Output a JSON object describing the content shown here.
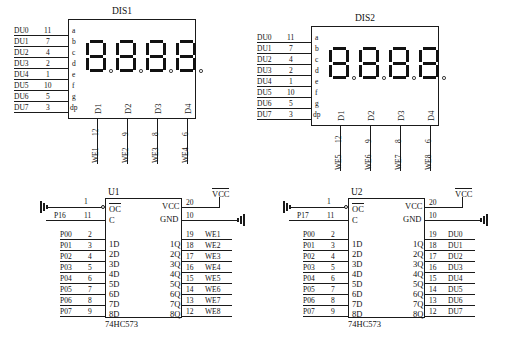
{
  "diagram": {
    "line_color": "#1a1a1a",
    "background": "#ffffff"
  },
  "displays": [
    {
      "ref": "DIS1",
      "segment_labels": [
        "a",
        "b",
        "c",
        "d",
        "e",
        "f",
        "g",
        "dp"
      ],
      "digit_labels": [
        "D1",
        "D2",
        "D3",
        "D4"
      ],
      "segment_nets": [
        {
          "net": "DU0",
          "pin": "11"
        },
        {
          "net": "DU1",
          "pin": "7"
        },
        {
          "net": "DU2",
          "pin": "4"
        },
        {
          "net": "DU3",
          "pin": "2"
        },
        {
          "net": "DU4",
          "pin": "1"
        },
        {
          "net": "DU5",
          "pin": "10"
        },
        {
          "net": "DU6",
          "pin": "5"
        },
        {
          "net": "DU7",
          "pin": "3"
        }
      ],
      "digit_nets": [
        {
          "net": "WE1",
          "pin": "12"
        },
        {
          "net": "WE2",
          "pin": "9"
        },
        {
          "net": "WE3",
          "pin": "8"
        },
        {
          "net": "WE4",
          "pin": "6"
        }
      ]
    },
    {
      "ref": "DIS2",
      "segment_labels": [
        "a",
        "b",
        "c",
        "d",
        "e",
        "f",
        "g",
        "dp"
      ],
      "digit_labels": [
        "D1",
        "D2",
        "D3",
        "D4"
      ],
      "segment_nets": [
        {
          "net": "DU0",
          "pin": "11"
        },
        {
          "net": "DU1",
          "pin": "7"
        },
        {
          "net": "DU2",
          "pin": "4"
        },
        {
          "net": "DU3",
          "pin": "2"
        },
        {
          "net": "DU4",
          "pin": "1"
        },
        {
          "net": "DU5",
          "pin": "10"
        },
        {
          "net": "DU6",
          "pin": "5"
        },
        {
          "net": "DU7",
          "pin": "3"
        }
      ],
      "digit_nets": [
        {
          "net": "WE5",
          "pin": "12"
        },
        {
          "net": "WE6",
          "pin": "9"
        },
        {
          "net": "WE7",
          "pin": "8"
        },
        {
          "net": "WE8",
          "pin": "6"
        }
      ]
    }
  ],
  "latches": [
    {
      "ref": "U1",
      "part": "74HC573",
      "power": {
        "vcc_label": "VCC",
        "vcc_pin_name": "VCC",
        "vcc_pin": "20",
        "gnd_pin_name": "GND",
        "gnd_pin": "10"
      },
      "control": [
        {
          "pin_name": "OC",
          "pin": "1",
          "net": "",
          "inverted": true
        },
        {
          "pin_name": "C",
          "pin": "11",
          "net": "P16",
          "inverted": false
        }
      ],
      "inputs": [
        {
          "pin_name": "1D",
          "pin": "2",
          "net": "P00"
        },
        {
          "pin_name": "2D",
          "pin": "3",
          "net": "P01"
        },
        {
          "pin_name": "3D",
          "pin": "4",
          "net": "P02"
        },
        {
          "pin_name": "4D",
          "pin": "5",
          "net": "P03"
        },
        {
          "pin_name": "5D",
          "pin": "6",
          "net": "P04"
        },
        {
          "pin_name": "6D",
          "pin": "7",
          "net": "P05"
        },
        {
          "pin_name": "7D",
          "pin": "8",
          "net": "P06"
        },
        {
          "pin_name": "8D",
          "pin": "9",
          "net": "P07"
        }
      ],
      "outputs": [
        {
          "pin_name": "1Q",
          "pin": "19",
          "net": "WE1"
        },
        {
          "pin_name": "2Q",
          "pin": "18",
          "net": "WE2"
        },
        {
          "pin_name": "3Q",
          "pin": "17",
          "net": "WE3"
        },
        {
          "pin_name": "4Q",
          "pin": "16",
          "net": "WE4"
        },
        {
          "pin_name": "5Q",
          "pin": "15",
          "net": "WE5"
        },
        {
          "pin_name": "6Q",
          "pin": "14",
          "net": "WE6"
        },
        {
          "pin_name": "7Q",
          "pin": "13",
          "net": "WE7"
        },
        {
          "pin_name": "8Q",
          "pin": "12",
          "net": "WE8"
        }
      ]
    },
    {
      "ref": "U2",
      "part": "74HC573",
      "power": {
        "vcc_label": "VCC",
        "vcc_pin_name": "VCC",
        "vcc_pin": "20",
        "gnd_pin_name": "GND",
        "gnd_pin": "10"
      },
      "control": [
        {
          "pin_name": "OC",
          "pin": "1",
          "net": "",
          "inverted": true
        },
        {
          "pin_name": "C",
          "pin": "11",
          "net": "P17",
          "inverted": false
        }
      ],
      "inputs": [
        {
          "pin_name": "1D",
          "pin": "2",
          "net": "P00"
        },
        {
          "pin_name": "2D",
          "pin": "3",
          "net": "P01"
        },
        {
          "pin_name": "3D",
          "pin": "4",
          "net": "P02"
        },
        {
          "pin_name": "4D",
          "pin": "5",
          "net": "P03"
        },
        {
          "pin_name": "5D",
          "pin": "6",
          "net": "P04"
        },
        {
          "pin_name": "6D",
          "pin": "7",
          "net": "P05"
        },
        {
          "pin_name": "7D",
          "pin": "8",
          "net": "P06"
        },
        {
          "pin_name": "8D",
          "pin": "9",
          "net": "P07"
        }
      ],
      "outputs": [
        {
          "pin_name": "1Q",
          "pin": "19",
          "net": "DU0"
        },
        {
          "pin_name": "2Q",
          "pin": "18",
          "net": "DU1"
        },
        {
          "pin_name": "3Q",
          "pin": "17",
          "net": "DU2"
        },
        {
          "pin_name": "4Q",
          "pin": "16",
          "net": "DU3"
        },
        {
          "pin_name": "5Q",
          "pin": "15",
          "net": "DU4"
        },
        {
          "pin_name": "6Q",
          "pin": "14",
          "net": "DU5"
        },
        {
          "pin_name": "7Q",
          "pin": "13",
          "net": "DU6"
        },
        {
          "pin_name": "8Q",
          "pin": "12",
          "net": "DU7"
        }
      ]
    }
  ]
}
